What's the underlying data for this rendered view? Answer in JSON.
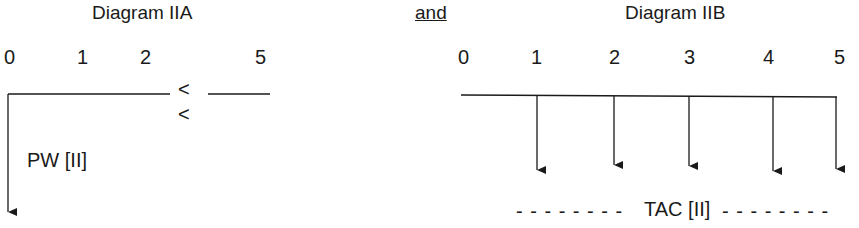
{
  "diagram_a": {
    "title": "Diagram IIA",
    "ticks": [
      "0",
      "1",
      "2",
      "5"
    ],
    "break_marks": [
      "<",
      "<"
    ],
    "arrow_label": "PW [II]"
  },
  "connector": {
    "label": "and"
  },
  "diagram_b": {
    "title": "Diagram IIB",
    "ticks": [
      "0",
      "1",
      "2",
      "3",
      "4",
      "5"
    ],
    "arrow_label": "TAC [II]",
    "dash_left": "- - - - - - - -",
    "dash_right": "- - - - - - - -"
  }
}
